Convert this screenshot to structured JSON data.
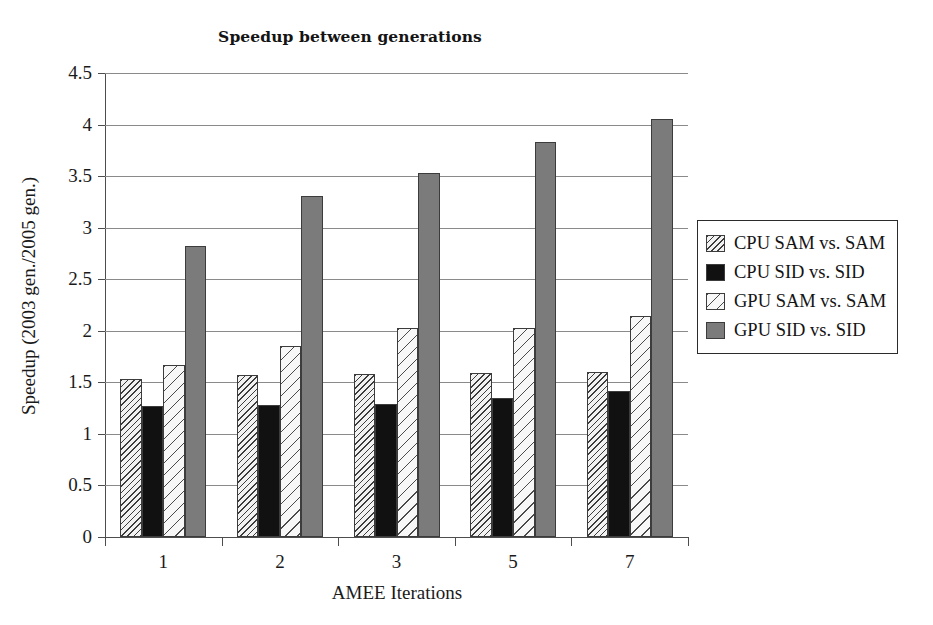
{
  "chart_data": {
    "type": "bar",
    "title": "Speedup between generations",
    "xlabel": "AMEE Iterations",
    "ylabel": "Speedup (2003 gen./2005 gen.)",
    "categories": [
      "1",
      "2",
      "3",
      "5",
      "7"
    ],
    "ylim": [
      0,
      4.5
    ],
    "yticks": [
      "0",
      "0.5",
      "1",
      "1.5",
      "2",
      "2.5",
      "3",
      "3.5",
      "4",
      "4.5"
    ],
    "ytick_values": [
      0,
      0.5,
      1,
      1.5,
      2,
      2.5,
      3,
      3.5,
      4,
      4.5
    ],
    "grid": true,
    "legend_position": "right",
    "series": [
      {
        "name": "CPU SAM vs. SAM",
        "fill": "cpu-sam",
        "values": [
          1.53,
          1.57,
          1.58,
          1.59,
          1.6
        ]
      },
      {
        "name": "CPU SID vs. SID",
        "fill": "cpu-sid",
        "values": [
          1.27,
          1.28,
          1.29,
          1.35,
          1.42
        ]
      },
      {
        "name": "GPU SAM vs. SAM",
        "fill": "gpu-sam",
        "values": [
          1.67,
          1.85,
          2.03,
          2.03,
          2.14
        ]
      },
      {
        "name": "GPU SID vs. SID",
        "fill": "gpu-sid",
        "values": [
          2.82,
          3.31,
          3.53,
          3.83,
          4.05
        ]
      }
    ]
  },
  "colors": {
    "cpu_sid": "#111111",
    "gpu_sid": "#7b7b7b",
    "gridline": "#8a8a8a",
    "axis": "#4d4d4d"
  }
}
